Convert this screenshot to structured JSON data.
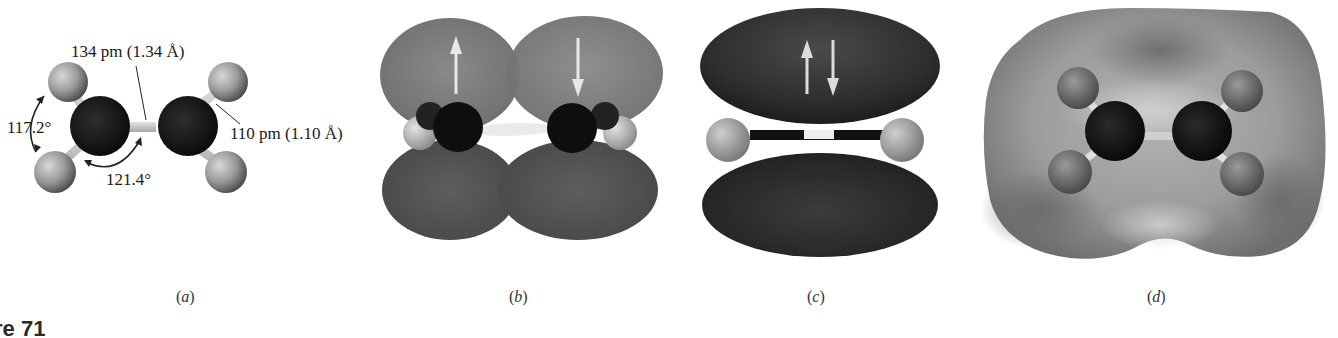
{
  "figure": {
    "number_label_partial": "re 71",
    "molecule": "ethylene"
  },
  "panels": [
    {
      "id": "a",
      "caption": "a",
      "description": "ball-and-stick model",
      "annotations": {
        "cc_bond_length": "134 pm (1.34 Å)",
        "ch_bond_length": "110 pm (1.10 Å)",
        "hch_angle": "117.2°",
        "hcc_angle": "121.4°"
      }
    },
    {
      "id": "b",
      "caption": "b",
      "description": "two p orbitals, one electron each",
      "spin_arrows": [
        "up",
        "down"
      ]
    },
    {
      "id": "c",
      "caption": "c",
      "description": "pi bond with paired electrons",
      "spin_arrows": [
        "up",
        "down"
      ]
    },
    {
      "id": "d",
      "caption": "d",
      "description": "electrostatic potential map"
    }
  ],
  "colors": {
    "carbon": "#141414",
    "hydrogen": "#9a9a9a",
    "bond": "#c8c8c8",
    "orbital_top": "#7d7d7d",
    "orbital_bottom": "#575757",
    "pi_lobe": "#3a3a3a",
    "epm_surface": "#9b9b9b",
    "arrow": "#e6e6e6"
  }
}
